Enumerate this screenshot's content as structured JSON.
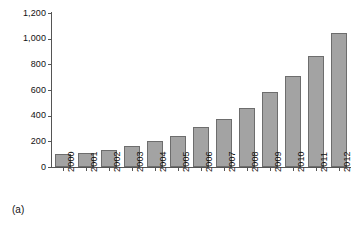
{
  "chart_data": {
    "type": "bar",
    "title": "",
    "subtitle": "",
    "xlabel": "",
    "ylabel": "",
    "categories": [
      "2000",
      "2001",
      "2002",
      "2003",
      "2004",
      "2005",
      "2006",
      "2007",
      "2008",
      "2009",
      "2010",
      "2011",
      "2012"
    ],
    "values": [
      100,
      110,
      130,
      160,
      205,
      240,
      310,
      375,
      460,
      585,
      710,
      865,
      1045
    ],
    "ylim": [
      0,
      1200
    ],
    "ytick_values": [
      0,
      200,
      400,
      600,
      800,
      1000,
      1200
    ],
    "ytick_labels": [
      "0",
      "200",
      "400",
      "600",
      "800",
      "1,000",
      "1,200"
    ],
    "grid": false,
    "legend": null,
    "annotations": []
  },
  "caption": {
    "label": "(a)"
  },
  "style": {
    "bar_fill": "#a3a3a3",
    "bar_border": "#6d6d6d",
    "axis_color": "#555555",
    "text_color": "#111111",
    "background": "#ffffff"
  }
}
